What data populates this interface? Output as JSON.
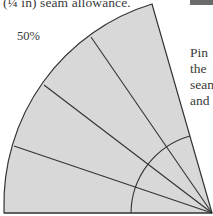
{
  "caption": "(¼ in) seam allowance.",
  "scale_label": "50%",
  "body_text_lines": [
    "Pin",
    "the",
    "seam",
    "and"
  ],
  "colors": {
    "fill": "#d8d8d8",
    "stroke": "#333333",
    "bar": "#6b6b6b"
  },
  "diagram": {
    "name": "fan-template",
    "center": [
      212,
      213
    ],
    "outer_radius": 209,
    "inner_radius": 81,
    "segments": 5
  }
}
